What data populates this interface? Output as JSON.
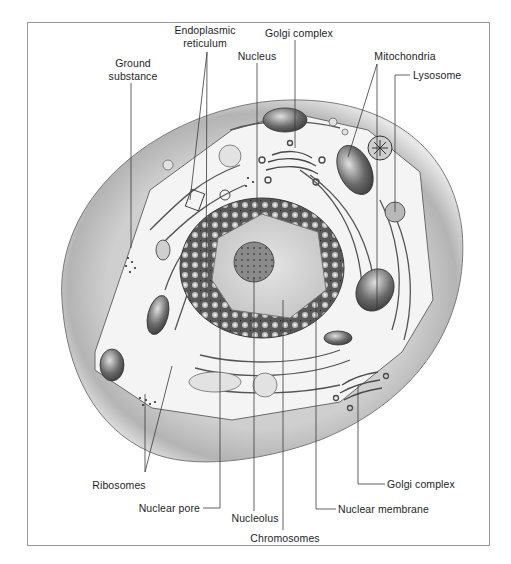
{
  "figure": {
    "frame": {
      "x": 27,
      "y": 22,
      "w": 463,
      "h": 524,
      "border_color": "#9a9a9a"
    },
    "colors": {
      "background": "#ffffff",
      "cell_wall_shade": "#b9b9b9",
      "cell_wall_light": "#e4e4e4",
      "cytoplasm": "#f3f3f3",
      "nucleus_outer": "#5a5a5a",
      "nucleoplasm": "#dadada",
      "ink": "#2a2a2a",
      "label_text": "#1e1e1e",
      "leader_line": "#3a3a3a"
    }
  },
  "labels": [
    {
      "id": "endoplasmic-reticulum",
      "lines": [
        "Endoplasmic",
        "reticulum"
      ],
      "x": 205,
      "y": 24,
      "align": "c"
    },
    {
      "id": "golgi-complex-top",
      "lines": [
        "Golgi complex"
      ],
      "x": 299,
      "y": 27,
      "align": "c"
    },
    {
      "id": "nucleus",
      "lines": [
        "Nucleus"
      ],
      "x": 257,
      "y": 50,
      "align": "c"
    },
    {
      "id": "ground-substance",
      "lines": [
        "Ground",
        "substance"
      ],
      "x": 133,
      "y": 57,
      "align": "c"
    },
    {
      "id": "mitochondria",
      "lines": [
        "Mitochondria"
      ],
      "x": 405,
      "y": 50,
      "align": "c"
    },
    {
      "id": "lysosome",
      "lines": [
        "Lysosome"
      ],
      "x": 413,
      "y": 69,
      "align": "l"
    },
    {
      "id": "ribosomes",
      "lines": [
        "Ribosomes"
      ],
      "x": 119,
      "y": 479,
      "align": "c"
    },
    {
      "id": "golgi-complex-bottom",
      "lines": [
        "Golgi complex"
      ],
      "x": 387,
      "y": 478,
      "align": "l"
    },
    {
      "id": "nuclear-pore",
      "lines": [
        "Nuclear  pore"
      ],
      "x": 200,
      "y": 502,
      "align": "r"
    },
    {
      "id": "nuclear-membrane",
      "lines": [
        "Nuclear  membrane"
      ],
      "x": 338,
      "y": 503,
      "align": "l"
    },
    {
      "id": "nucleolus",
      "lines": [
        "Nucleolus"
      ],
      "x": 255,
      "y": 512,
      "align": "c"
    },
    {
      "id": "chromosomes",
      "lines": [
        "Chromosomes"
      ],
      "x": 285,
      "y": 532,
      "align": "c"
    }
  ],
  "leaders": [
    {
      "for": "endoplasmic-reticulum",
      "points": [
        [
          207,
          52
        ],
        [
          190,
          200
        ]
      ]
    },
    {
      "for": "endoplasmic-reticulum",
      "points": [
        [
          207,
          52
        ],
        [
          206,
          300
        ]
      ]
    },
    {
      "for": "golgi-complex-top",
      "points": [
        [
          295,
          40
        ],
        [
          295,
          148
        ]
      ]
    },
    {
      "for": "nucleus",
      "points": [
        [
          257,
          63
        ],
        [
          257,
          210
        ]
      ]
    },
    {
      "for": "ground-substance",
      "points": [
        [
          131,
          83
        ],
        [
          131,
          248
        ]
      ]
    },
    {
      "for": "mitochondria",
      "points": [
        [
          377,
          64
        ],
        [
          348,
          157
        ]
      ]
    },
    {
      "for": "mitochondria",
      "points": [
        [
          377,
          64
        ],
        [
          377,
          310
        ]
      ]
    },
    {
      "for": "lysosome",
      "points": [
        [
          410,
          75
        ],
        [
          395,
          75
        ],
        [
          395,
          212
        ]
      ]
    },
    {
      "for": "ribosomes",
      "points": [
        [
          145,
          472
        ],
        [
          145,
          394
        ]
      ]
    },
    {
      "for": "ribosomes",
      "points": [
        [
          145,
          472
        ],
        [
          172,
          366
        ]
      ]
    },
    {
      "for": "golgi-complex-bottom",
      "points": [
        [
          385,
          484
        ],
        [
          358,
          484
        ],
        [
          358,
          385
        ]
      ]
    },
    {
      "for": "nuclear-pore",
      "points": [
        [
          203,
          508
        ],
        [
          220,
          508
        ],
        [
          220,
          322
        ]
      ]
    },
    {
      "for": "nuclear-membrane",
      "points": [
        [
          336,
          509
        ],
        [
          316,
          509
        ],
        [
          316,
          302
        ]
      ]
    },
    {
      "for": "nucleolus",
      "points": [
        [
          254,
          511
        ],
        [
          254,
          278
        ]
      ]
    },
    {
      "for": "chromosomes",
      "points": [
        [
          283,
          530
        ],
        [
          283,
          300
        ]
      ]
    }
  ]
}
